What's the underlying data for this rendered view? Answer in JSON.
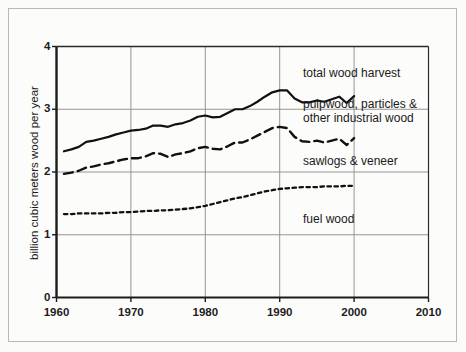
{
  "chart_data": {
    "type": "line",
    "title": "",
    "subtitle": "",
    "xlabel": "",
    "ylabel": "billion cubic meters wood per year",
    "xlim": [
      1960,
      2010
    ],
    "ylim": [
      0,
      4
    ],
    "xticks": [
      "1960",
      "1970",
      "1980",
      "1990",
      "2000",
      "2010"
    ],
    "yticks": [
      "0",
      "1",
      "2",
      "3",
      "4"
    ],
    "grid": true,
    "legend_position": "inline-annotations",
    "x": [
      1961,
      1962,
      1963,
      1964,
      1965,
      1966,
      1967,
      1968,
      1969,
      1970,
      1971,
      1972,
      1973,
      1974,
      1975,
      1976,
      1977,
      1978,
      1979,
      1980,
      1981,
      1982,
      1983,
      1984,
      1985,
      1986,
      1987,
      1988,
      1989,
      1990,
      1991,
      1992,
      1993,
      1994,
      1995,
      1996,
      1997,
      1998,
      1999,
      2000
    ],
    "series": [
      {
        "name": "total wood harvest",
        "style": "solid",
        "color": "#111111",
        "values": [
          2.33,
          2.36,
          2.4,
          2.48,
          2.5,
          2.53,
          2.56,
          2.6,
          2.63,
          2.66,
          2.67,
          2.69,
          2.74,
          2.74,
          2.72,
          2.76,
          2.78,
          2.82,
          2.88,
          2.9,
          2.87,
          2.88,
          2.94,
          3.0,
          3.0,
          3.05,
          3.12,
          3.2,
          3.27,
          3.3,
          3.3,
          3.17,
          3.11,
          3.11,
          3.14,
          3.12,
          3.16,
          3.2,
          3.1,
          3.21
        ]
      },
      {
        "name": "pulpwood, particles & other industrial wood / sawlogs & veneer",
        "style": "dashed",
        "color": "#111111",
        "values": [
          1.97,
          1.99,
          2.02,
          2.07,
          2.09,
          2.12,
          2.14,
          2.17,
          2.2,
          2.22,
          2.22,
          2.25,
          2.3,
          2.29,
          2.24,
          2.28,
          2.3,
          2.33,
          2.38,
          2.4,
          2.37,
          2.36,
          2.41,
          2.47,
          2.47,
          2.52,
          2.58,
          2.64,
          2.7,
          2.72,
          2.7,
          2.56,
          2.49,
          2.48,
          2.5,
          2.47,
          2.5,
          2.53,
          2.43,
          2.54
        ]
      },
      {
        "name": "fuel wood",
        "style": "dotted",
        "color": "#111111",
        "values": [
          1.33,
          1.33,
          1.34,
          1.34,
          1.34,
          1.34,
          1.35,
          1.35,
          1.36,
          1.36,
          1.37,
          1.38,
          1.38,
          1.39,
          1.39,
          1.4,
          1.41,
          1.42,
          1.44,
          1.46,
          1.49,
          1.52,
          1.55,
          1.58,
          1.6,
          1.63,
          1.66,
          1.69,
          1.71,
          1.73,
          1.74,
          1.75,
          1.76,
          1.76,
          1.76,
          1.77,
          1.77,
          1.77,
          1.78,
          1.78
        ]
      }
    ],
    "annotations": [
      {
        "text": "total wood harvest",
        "x_px": 303,
        "y_px": 66
      },
      {
        "text": "pulpwood, particles &",
        "x_px": 303,
        "y_px": 97
      },
      {
        "text": "other industrial wood",
        "x_px": 303,
        "y_px": 111
      },
      {
        "text": "sawlogs & veneer",
        "x_px": 303,
        "y_px": 154
      },
      {
        "text": "fuel wood",
        "x_px": 303,
        "y_px": 212
      }
    ]
  }
}
